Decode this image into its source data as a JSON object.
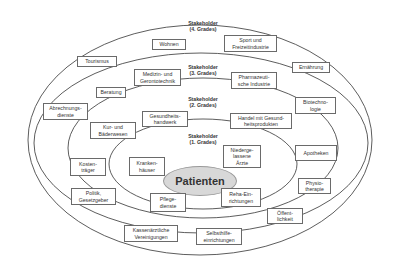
{
  "diagram": {
    "center": "Patienten",
    "rings": [
      {
        "label": "Stakeholder\n(1. Grades)",
        "items": [
          "Kranken-\nhäuser",
          "Niederge-\nlassene\nÄrzte",
          "Pflege-\ndienste",
          "Reha-Ein-\nrichtungen"
        ]
      },
      {
        "label": "Stakeholder\n(2. Grades)",
        "items": [
          "Gesundheits-\nhandwerk",
          "Handel mit Gesund-\nheitsprodukten",
          "Kur- und\nBäderwesen",
          "Kosten-\nträger",
          "Politik,\nGesetzgeber",
          "Apotheken",
          "Physio-\ntherapie",
          "Öffent-\nlichkeit",
          "Kassenärztliche\nVereinigungen",
          "Selbsthilfe-\neinrichtungen"
        ]
      },
      {
        "label": "Stakeholder\n(3. Grades)",
        "items": [
          "Medizin- und\nGerontotechnik",
          "Pharmazeuti-\nsche Industrie",
          "Beratung",
          "Abrechnungs-\ndienste",
          "Biotechno-\nlogie"
        ]
      },
      {
        "label": "Stakeholder\n(4. Grades)",
        "items": [
          "Wohnen",
          "Sport und\nFreizeitindustrie",
          "Tourismus",
          "Ernährung"
        ]
      }
    ]
  }
}
